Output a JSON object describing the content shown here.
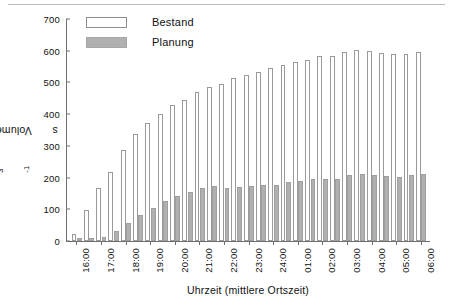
{
  "chart_data": {
    "type": "bar",
    "title": "",
    "xlabel": "Uhrzeit (mittlere Ortszeit)",
    "ylabel": "Volumenfluß in  m3s-1",
    "ylabel_parts": {
      "lead": "Volumenfluß in  m",
      "exp1": "3",
      "mid": "s",
      "exp2": "-1"
    },
    "ylim": [
      0,
      700
    ],
    "yticks": [
      0,
      100,
      200,
      300,
      400,
      500,
      600,
      700
    ],
    "ytick_labels": [
      "0",
      "100",
      "200",
      "300",
      "400",
      "500",
      "600",
      "700"
    ],
    "grid": false,
    "legend_position": "top-left",
    "categories": [
      "16:00",
      "16:30",
      "17:00",
      "17:30",
      "18:00",
      "18:30",
      "19:00",
      "19:30",
      "20:00",
      "20:30",
      "21:00",
      "21:30",
      "22:00",
      "22:30",
      "23:00",
      "23:30",
      "24:00",
      "00:30",
      "01:00",
      "01:30",
      "02:00",
      "02:30",
      "03:00",
      "03:30",
      "04:00",
      "04:30",
      "05:00",
      "05:30",
      "06:00"
    ],
    "xtick_labels": [
      "16:00",
      "17:00",
      "18:00",
      "19:00",
      "20:00",
      "21:00",
      "22:00",
      "23:00",
      "24:00",
      "01:00",
      "02:00",
      "03:00",
      "04:00",
      "05:00",
      "06:00"
    ],
    "series": [
      {
        "name": "Bestand",
        "color": "#ffffff",
        "edge_color": "#9a9a9a",
        "values": [
          22,
          98,
          166,
          219,
          288,
          338,
          371,
          400,
          428,
          445,
          470,
          487,
          495,
          513,
          522,
          532,
          546,
          556,
          563,
          571,
          583,
          584,
          596,
          603,
          598,
          594,
          590,
          591,
          596
        ]
      },
      {
        "name": "Planung",
        "color": "#b0b0b0",
        "edge_color": "#9f9f9f",
        "values": [
          8,
          11,
          14,
          33,
          57,
          83,
          104,
          125,
          141,
          156,
          166,
          172,
          166,
          170,
          173,
          176,
          178,
          187,
          190,
          194,
          195,
          197,
          208,
          210,
          208,
          205,
          203,
          207,
          210
        ]
      }
    ]
  },
  "legend": {
    "items": [
      {
        "label": "Bestand",
        "swatch": "bestand"
      },
      {
        "label": "Planung",
        "swatch": "planung"
      }
    ]
  }
}
